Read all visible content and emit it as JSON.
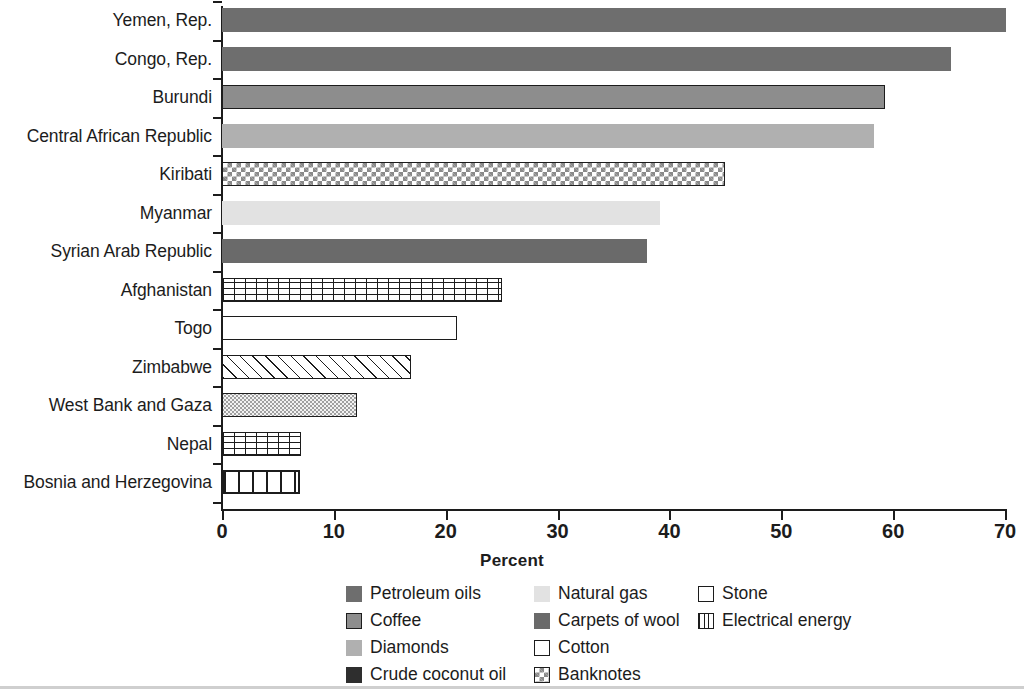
{
  "chart_data": {
    "type": "bar",
    "orientation": "horizontal",
    "title": "",
    "xlabel": "Percent",
    "ylabel": "",
    "xlim": [
      0,
      70
    ],
    "xticks": [
      0,
      10,
      20,
      30,
      40,
      50,
      60,
      70
    ],
    "xtick_labels": [
      "0",
      "10",
      "20",
      "30",
      "40",
      "50",
      "60",
      "70"
    ],
    "grid": false,
    "legend_position": "bottom",
    "categories": [
      "Yemen, Rep.",
      "Congo, Rep.",
      "Burundi",
      "Central African Republic",
      "Kiribati",
      "Myanmar",
      "Syrian Arab Republic",
      "Afghanistan",
      "Togo",
      "Zimbabwe",
      "West Bank and Gaza",
      "Nepal",
      "Bosnia and Herzegovina"
    ],
    "values": [
      70.1,
      65.2,
      59.3,
      58.3,
      45.0,
      39.2,
      38.0,
      25.0,
      21.0,
      16.9,
      12.1,
      7.1,
      7.0
    ],
    "bar_products": [
      "Petroleum oils",
      "Petroleum oils",
      "Coffee",
      "Diamonds",
      "Banknotes",
      "Natural gas",
      "Petroleum oils",
      "Electrical energy",
      "Stone",
      "Carpets of wool",
      "Crude coconut oil",
      "Electrical energy",
      "Cotton"
    ],
    "legend": [
      {
        "label": "Petroleum oils",
        "pattern": "solid-medium-gray",
        "color": "#6e6e6e"
      },
      {
        "label": "Natural gas",
        "pattern": "solid-very-light-gray",
        "color": "#e2e2e2"
      },
      {
        "label": "Stone",
        "pattern": "outline-white",
        "color": "#ffffff"
      },
      {
        "label": "Coffee",
        "pattern": "solid-gray-outlined",
        "color": "#8d8d8d"
      },
      {
        "label": "Carpets of wool",
        "pattern": "solid-dark-gray",
        "color": "#6a6a6a"
      },
      {
        "label": "Electrical energy",
        "pattern": "vertical-lines",
        "color": "#ffffff"
      },
      {
        "label": "Diamonds",
        "pattern": "solid-light-gray",
        "color": "#b0b0b0"
      },
      {
        "label": "Cotton",
        "pattern": "outline-white",
        "color": "#ffffff"
      },
      {
        "label": "Crude coconut oil",
        "pattern": "solid-near-black",
        "color": "#2e2e2e"
      },
      {
        "label": "Banknotes",
        "pattern": "checkerboard",
        "color": "#8a8a8a"
      }
    ]
  },
  "axis": {
    "title": "Percent",
    "ticks": [
      "0",
      "10",
      "20",
      "30",
      "40",
      "50",
      "60",
      "70"
    ]
  },
  "rows": [
    {
      "label": "Yemen, Rep.",
      "value": 70.1,
      "fill": "f-petroleum"
    },
    {
      "label": "Congo, Rep.",
      "value": 65.2,
      "fill": "f-petroleum"
    },
    {
      "label": "Burundi",
      "value": 59.3,
      "fill": "f-coffee"
    },
    {
      "label": "Central African Republic",
      "value": 58.3,
      "fill": "f-diamonds"
    },
    {
      "label": "Kiribati",
      "value": 45.0,
      "fill": "f-banknotes"
    },
    {
      "label": "Myanmar",
      "value": 39.2,
      "fill": "f-natgas"
    },
    {
      "label": "Syrian Arab Republic",
      "value": 38.0,
      "fill": "f-carpets"
    },
    {
      "label": "Afghanistan",
      "value": 25.0,
      "fill": "f-grid"
    },
    {
      "label": "Togo",
      "value": 21.0,
      "fill": "f-stone"
    },
    {
      "label": "Zimbabwe",
      "value": 16.9,
      "fill": "f-diagonal"
    },
    {
      "label": "West Bank and Gaza",
      "value": 12.1,
      "fill": "f-stipple"
    },
    {
      "label": "Nepal",
      "value": 7.1,
      "fill": "f-grid"
    },
    {
      "label": "Bosnia and Herzegovina",
      "value": 7.0,
      "fill": "f-bands"
    }
  ],
  "legend_grid": [
    [
      {
        "label": "Petroleum oils",
        "fill": "f-petroleum"
      },
      {
        "label": "Natural gas",
        "fill": "f-natgas"
      },
      {
        "label": "Stone",
        "fill": "f-stone"
      }
    ],
    [
      {
        "label": "Coffee",
        "fill": "f-coffee"
      },
      {
        "label": "Carpets of wool",
        "fill": "f-carpets"
      },
      {
        "label": "Electrical energy",
        "fill": "f-electrical"
      }
    ],
    [
      {
        "label": "Diamonds",
        "fill": "f-diamonds"
      },
      {
        "label": "Cotton",
        "fill": "f-cotton"
      }
    ],
    [
      {
        "label": "Crude coconut oil",
        "fill": "f-coconut"
      },
      {
        "label": "Banknotes",
        "fill": "f-banknotes"
      }
    ]
  ]
}
